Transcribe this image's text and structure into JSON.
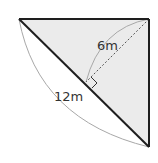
{
  "diagram": {
    "type": "right-triangle-geometry",
    "colors": {
      "fill": "#ebebeb",
      "edge": "#1e1e1e",
      "brace": "#a8a8a8",
      "dashed": "#555555",
      "text": "#333333"
    },
    "vertices": {
      "top_left": [
        19,
        19
      ],
      "top_right": [
        149,
        19
      ],
      "bottom_right": [
        149,
        147
      ]
    },
    "altitude_foot": [
      86,
      82
    ],
    "labels": {
      "altitude_length": "6m",
      "hypotenuse_length": "12m"
    }
  }
}
